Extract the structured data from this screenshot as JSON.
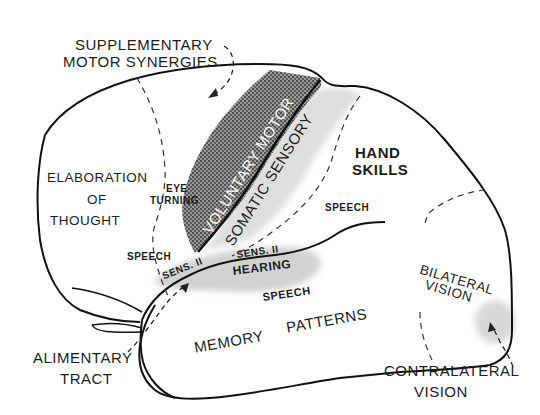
{
  "figure": {
    "type": "lateral view of left cerebral hemisphere with functional areas",
    "colors": {
      "outline": "#1a1a1a",
      "motor_strip_fill": "#6e6e6e",
      "sensory_shading": "#d9d9d9",
      "hearing_shading": "#d4d4d4",
      "vision_shading": "#dcdcdc",
      "text": "#1c1c1c"
    }
  },
  "labels": {
    "supplementary_line1": "SUPPLEMENTARY",
    "supplementary_line2": "MOTOR SYNERGIES",
    "elaboration_line1": "ELABORATION",
    "elaboration_line2": "OF",
    "elaboration_line3": "THOUGHT",
    "eye_line1": "EYE",
    "eye_line2": "TURNING",
    "voluntary_motor": "VOLUNTARY MOTOR",
    "somatic_sensory": "SOMATIC SENSORY",
    "hand_line1": "HAND",
    "hand_line2": "SKILLS",
    "speech_upper": "SPEECH",
    "speech_left": "SPEECH",
    "sens2_left": "SENS. II",
    "sens2_mid": "SENS. II",
    "hearing": "HEARING",
    "speech_lower": "SPEECH",
    "memory": "MEMORY",
    "patterns": "PATTERNS",
    "bilateral_line1": "BILATERAL",
    "bilateral_line2": "VISION",
    "alimentary_line1": "ALIMENTARY",
    "alimentary_line2": "TRACT",
    "contralateral_line1": "CONTRALATERAL",
    "contralateral_line2": "VISION"
  }
}
